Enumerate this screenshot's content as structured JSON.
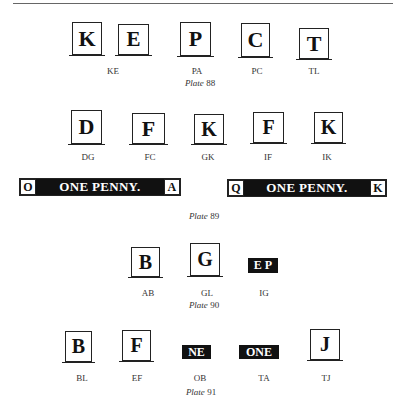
{
  "plates": [
    {
      "label_prefix": "Plate",
      "number": "88",
      "items": [
        {
          "letter": "K",
          "caption": "KE"
        },
        {
          "letter": "E",
          "caption": ""
        },
        {
          "letter": "P",
          "caption": "PA"
        },
        {
          "letter": "C",
          "caption": "PC"
        },
        {
          "letter": "T",
          "caption": "TL"
        }
      ]
    },
    {
      "label_prefix": "Plate",
      "number": "89",
      "items": [
        {
          "letter": "D",
          "caption": "DG"
        },
        {
          "letter": "F",
          "caption": "FC"
        },
        {
          "letter": "K",
          "caption": "GK"
        },
        {
          "letter": "F",
          "caption": "IF"
        },
        {
          "letter": "K",
          "caption": "IK"
        }
      ],
      "banners": [
        {
          "left": "O",
          "text": "ONE PENNY.",
          "right": "A"
        },
        {
          "left": "Q",
          "text": "ONE PENNY.",
          "right": "K"
        }
      ]
    },
    {
      "label_prefix": "Plate",
      "number": "90",
      "items": [
        {
          "letter": "B",
          "caption": "AB"
        },
        {
          "letter": "G",
          "caption": "GL"
        },
        {
          "letter": "E P",
          "caption": "IG"
        }
      ]
    },
    {
      "label_prefix": "Plate",
      "number": "91",
      "items": [
        {
          "letter": "B",
          "caption": "BL"
        },
        {
          "letter": "F",
          "caption": "EF"
        },
        {
          "letter": "NE",
          "caption": "OB"
        },
        {
          "letter": "ONE",
          "caption": "TA"
        },
        {
          "letter": "J",
          "caption": "TJ"
        }
      ]
    }
  ]
}
